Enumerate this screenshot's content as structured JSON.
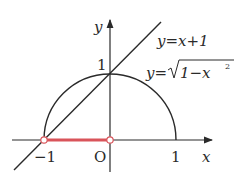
{
  "diagram": {
    "axes": {
      "x_label": "x",
      "y_label": "y",
      "origin_label": "O",
      "tick_labels": {
        "x_neg1": "−1",
        "x_pos1": "1",
        "y_pos1": "1"
      }
    },
    "curves": [
      {
        "name": "line",
        "equation": "y=x+1"
      },
      {
        "name": "semicircle",
        "equation_prefix": "y=",
        "radicand": "1−x",
        "exponent": "2"
      }
    ],
    "highlight_segment": {
      "from": -1,
      "to": 0,
      "color": "#d9545a",
      "endpoints": "open"
    },
    "colors": {
      "stroke": "#2a2a2a",
      "highlight": "#d9545a"
    }
  }
}
